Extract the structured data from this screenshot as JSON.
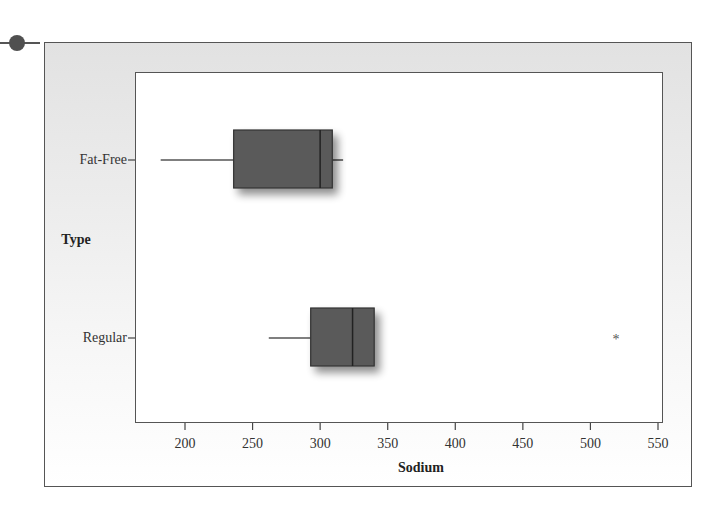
{
  "chart_data": {
    "type": "boxplot",
    "orientation": "horizontal",
    "title": "",
    "xlabel": "Sodium",
    "ylabel": "Type",
    "xlim": [
      165,
      555
    ],
    "xticks": [
      200,
      250,
      300,
      350,
      400,
      450,
      500,
      550
    ],
    "categories": [
      "Fat-Free",
      "Regular"
    ],
    "series": [
      {
        "name": "Fat-Free",
        "whisker_low": 182,
        "q1": 236,
        "median": 300,
        "q3": 309,
        "whisker_high": 317,
        "outliers": []
      },
      {
        "name": "Regular",
        "whisker_low": 262,
        "q1": 293,
        "median": 324,
        "q3": 340,
        "whisker_high": 340,
        "outliers": [
          519
        ]
      }
    ],
    "grid": false,
    "legend": null,
    "box_color": "#5a5a5a",
    "outlier_marker": "*"
  },
  "labels": {
    "xlabel": "Sodium",
    "ylabel": "Type",
    "cat0": "Fat-Free",
    "cat1": "Regular",
    "outlier_symbol": "*",
    "ticks": [
      "200",
      "250",
      "300",
      "350",
      "400",
      "450",
      "500",
      "550"
    ]
  }
}
